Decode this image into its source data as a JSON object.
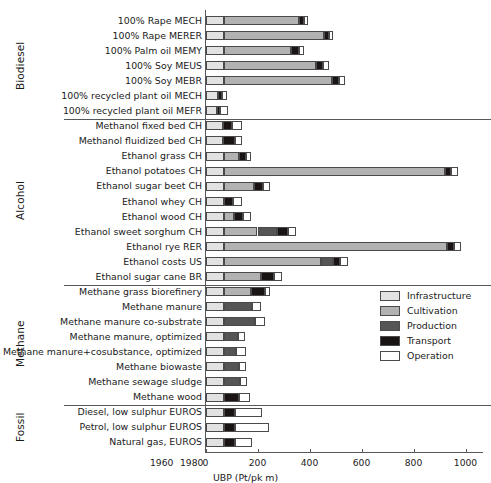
{
  "chart_data": {
    "type": "bar",
    "subtype": "horizontal-stacked",
    "title": "",
    "xlabel": "UBP (Pt/pk m)",
    "ylabel": "",
    "xlim": [
      0,
      1000
    ],
    "xticks": [
      0,
      200,
      400,
      600,
      800,
      1000
    ],
    "grid": false,
    "legend_position": "middle-right",
    "series": [
      {
        "name": "Infrastructure",
        "color": "#e2e2e2"
      },
      {
        "name": "Cultivation",
        "color": "#b2b2b2"
      },
      {
        "name": "Production",
        "color": "#555555"
      },
      {
        "name": "Transport",
        "color": "#1a1414"
      },
      {
        "name": "Operation",
        "color": "#ffffff"
      }
    ],
    "groups": [
      {
        "name": "Biodiesel",
        "rows": [
          {
            "label": "100% Rape MECH",
            "values": [
              70,
              290,
              0,
              18,
              15
            ]
          },
          {
            "label": "100% Rape MERER",
            "values": [
              70,
              385,
              0,
              20,
              17
            ]
          },
          {
            "label": "100% Palm oil MEMY",
            "values": [
              70,
              260,
              0,
              30,
              20
            ]
          },
          {
            "label": "100% Soy MEUS",
            "values": [
              70,
              355,
              0,
              27,
              22
            ]
          },
          {
            "label": "100% Soy MEBR",
            "values": [
              70,
              415,
              0,
              30,
              20
            ]
          },
          {
            "label": "100% recycled plant oil MECH",
            "values": [
              48,
              0,
              0,
              15,
              20
            ]
          },
          {
            "label": "100% recycled plant oil MEFR",
            "values": [
              43,
              0,
              0,
              14,
              28
            ]
          }
        ]
      },
      {
        "name": "Alcohol",
        "rows": [
          {
            "label": "Methanol fixed bed CH",
            "values": [
              68,
              0,
              0,
              34,
              38
            ]
          },
          {
            "label": "Methanol fluidized bed CH",
            "values": [
              66,
              0,
              0,
              48,
              28
            ]
          },
          {
            "label": "Ethanol grass CH",
            "values": [
              72,
              55,
              0,
              28,
              20
            ]
          },
          {
            "label": "Ethanol potatoes CH",
            "values": [
              70,
              850,
              0,
              25,
              28
            ]
          },
          {
            "label": "Ethanol sugar beet CH",
            "values": [
              70,
              115,
              0,
              38,
              27
            ]
          },
          {
            "label": "Ethanol whey CH",
            "values": [
              70,
              0,
              0,
              35,
              35
            ]
          },
          {
            "label": "Ethanol wood CH",
            "values": [
              70,
              38,
              0,
              36,
              32
            ]
          },
          {
            "label": "Ethanol sweet sorghum CH",
            "values": [
              70,
              130,
              75,
              42,
              33
            ]
          },
          {
            "label": "Ethanol rye RER",
            "values": [
              70,
              860,
              0,
              25,
              28
            ]
          },
          {
            "label": "Ethanol costs US",
            "values": [
              70,
              375,
              45,
              27,
              33
            ]
          },
          {
            "label": "Ethanol sugar cane BR",
            "values": [
              70,
              145,
              0,
              47,
              33
            ]
          }
        ]
      },
      {
        "name": "Methane",
        "rows": [
          {
            "label": "Methane grass biorefinery",
            "values": [
              70,
              105,
              0,
              52,
              22
            ]
          },
          {
            "label": "Methane manure",
            "values": [
              70,
              0,
              110,
              0,
              32
            ]
          },
          {
            "label": "Methane manure co-substrate",
            "values": [
              70,
              0,
              120,
              0,
              40
            ]
          },
          {
            "label": "Methane manure, optimized",
            "values": [
              70,
              0,
              55,
              0,
              25
            ]
          },
          {
            "label": "Methane manure+cosubstance, optimized",
            "values": [
              70,
              0,
              47,
              0,
              38
            ]
          },
          {
            "label": "Methane biowaste",
            "values": [
              70,
              0,
              60,
              0,
              25
            ]
          },
          {
            "label": "Methane sewage sludge",
            "values": [
              70,
              0,
              62,
              0,
              27
            ]
          },
          {
            "label": "Methane wood",
            "values": [
              70,
              0,
              0,
              58,
              45
            ]
          }
        ]
      },
      {
        "name": "Fossil",
        "rows": [
          {
            "label": "Diesel, low sulphur EUROS",
            "values": [
              70,
              0,
              0,
              42,
              105
            ]
          },
          {
            "label": "Petrol, low sulphur EUROS",
            "values": [
              70,
              0,
              0,
              45,
              130
            ]
          },
          {
            "label": "Natural gas, EUROS",
            "values": [
              70,
              0,
              0,
              42,
              68
            ]
          }
        ]
      }
    ],
    "ghost_axis_labels": [
      "1960",
      "1980"
    ]
  },
  "legend": {
    "items": [
      {
        "label": "Infrastructure",
        "color": "#e2e2e2"
      },
      {
        "label": "Cultivation",
        "color": "#b2b2b2"
      },
      {
        "label": "Production",
        "color": "#555555"
      },
      {
        "label": "Transport",
        "color": "#1a1414"
      },
      {
        "label": "Operation",
        "color": "#ffffff"
      }
    ]
  }
}
